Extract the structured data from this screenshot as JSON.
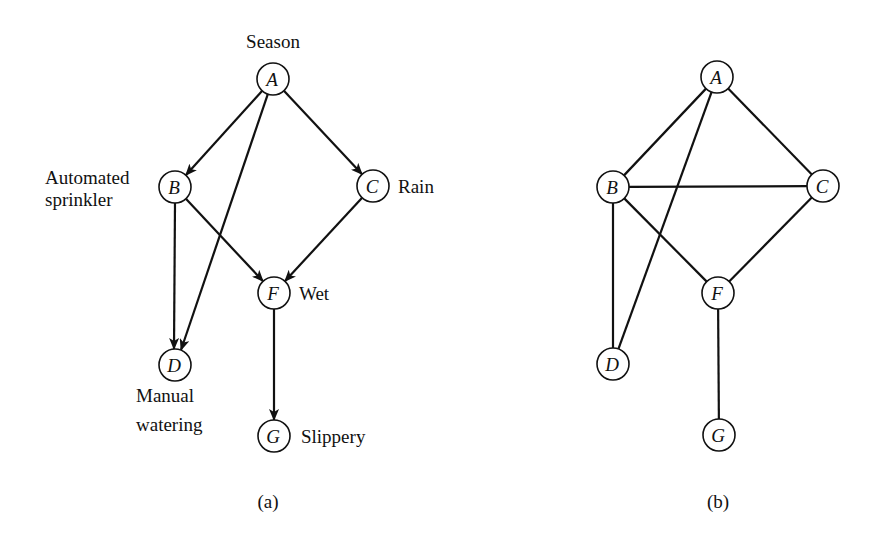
{
  "figure": {
    "panels": [
      {
        "id": "a",
        "caption": "(a)",
        "type": "directed",
        "nodes": [
          {
            "id": "A",
            "letter": "A",
            "label_lines": [
              "Season"
            ]
          },
          {
            "id": "B",
            "letter": "B",
            "label_lines": [
              "Automated",
              "sprinkler"
            ]
          },
          {
            "id": "C",
            "letter": "C",
            "label_lines": [
              "Rain"
            ]
          },
          {
            "id": "D",
            "letter": "D",
            "label_lines": [
              "Manual",
              "watering"
            ]
          },
          {
            "id": "F",
            "letter": "F",
            "label_lines": [
              "Wet"
            ]
          },
          {
            "id": "G",
            "letter": "G",
            "label_lines": [
              "Slippery"
            ]
          }
        ],
        "edges": [
          {
            "from": "A",
            "to": "B"
          },
          {
            "from": "A",
            "to": "C"
          },
          {
            "from": "A",
            "to": "D"
          },
          {
            "from": "B",
            "to": "D"
          },
          {
            "from": "B",
            "to": "F"
          },
          {
            "from": "C",
            "to": "F"
          },
          {
            "from": "F",
            "to": "G"
          }
        ]
      },
      {
        "id": "b",
        "caption": "(b)",
        "type": "undirected",
        "nodes": [
          {
            "id": "A",
            "letter": "A",
            "label_lines": []
          },
          {
            "id": "B",
            "letter": "B",
            "label_lines": []
          },
          {
            "id": "C",
            "letter": "C",
            "label_lines": []
          },
          {
            "id": "D",
            "letter": "D",
            "label_lines": []
          },
          {
            "id": "F",
            "letter": "F",
            "label_lines": []
          },
          {
            "id": "G",
            "letter": "G",
            "label_lines": []
          }
        ],
        "edges": [
          {
            "from": "A",
            "to": "B"
          },
          {
            "from": "A",
            "to": "C"
          },
          {
            "from": "A",
            "to": "D"
          },
          {
            "from": "B",
            "to": "C"
          },
          {
            "from": "B",
            "to": "D"
          },
          {
            "from": "B",
            "to": "F"
          },
          {
            "from": "C",
            "to": "F"
          },
          {
            "from": "F",
            "to": "G"
          }
        ]
      }
    ]
  }
}
